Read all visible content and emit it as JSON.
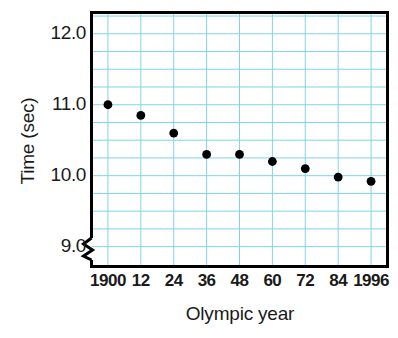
{
  "chart_data": {
    "type": "scatter",
    "title": "",
    "xlabel": "Olympic year",
    "ylabel": "Time (sec)",
    "categories": [
      "1900",
      "12",
      "24",
      "36",
      "48",
      "60",
      "72",
      "84",
      "1996"
    ],
    "x": [
      1900,
      1912,
      1924,
      1936,
      1948,
      1960,
      1972,
      1984,
      1996
    ],
    "values": [
      11.0,
      10.85,
      10.6,
      10.3,
      10.3,
      10.2,
      10.1,
      9.98,
      9.92
    ],
    "xtick_labels": [
      "1900",
      "12",
      "24",
      "36",
      "48",
      "60",
      "72",
      "84",
      "1996"
    ],
    "ytick_labels": [
      "12.0",
      "11.0",
      "10.0",
      "9.0"
    ],
    "ytick_values": [
      12.0,
      11.0,
      10.0,
      9.0
    ],
    "ylim": [
      8.72,
      12.3
    ],
    "xlim": [
      1894,
      2002
    ],
    "grid": true,
    "minor_grid_y_step": 0.25,
    "legend": "none",
    "axis_break_y": true,
    "colors": {
      "grid": "#7fd4ea",
      "frame": "#000000",
      "marker": "#000000",
      "background": "#ffffff",
      "text": "#1a1a1a"
    },
    "marker": {
      "shape": "circle",
      "radius": 4.4
    }
  }
}
